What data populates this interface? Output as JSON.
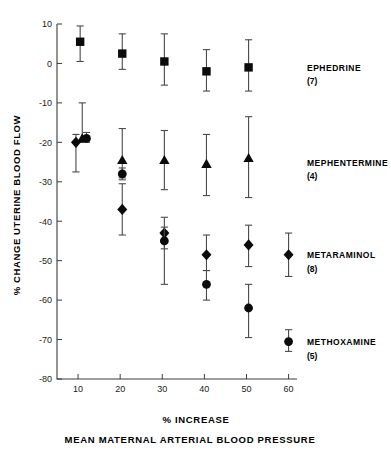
{
  "chart_data": {
    "type": "scatter",
    "title": "",
    "xlabel": "% INCREASE MEAN MATERNAL ARTERIAL BLOOD PRESSURE",
    "xlabel_line1": "% INCREASE",
    "xlabel_line2": "MEAN MATERNAL ARTERIAL BLOOD PRESSURE",
    "ylabel": "% CHANGE UTERINE BLOOD FLOW",
    "xlim": [
      5,
      62
    ],
    "ylim": [
      -80,
      10
    ],
    "xticks": [
      10,
      20,
      30,
      40,
      50,
      60
    ],
    "xtick_labels": [
      "10",
      "20",
      "30",
      "40",
      "50",
      "60"
    ],
    "yticks": [
      10,
      0,
      -10,
      -20,
      -30,
      -40,
      -50,
      -60,
      -70,
      -80
    ],
    "ytick_labels": [
      "10",
      "0",
      "-10",
      "-20",
      "-30",
      "-40",
      "-50",
      "-60",
      "-70",
      "-80"
    ],
    "grid": false,
    "legend_position": "right-inline",
    "error_type": "range",
    "series": [
      {
        "name": "EPHEDRINE",
        "n_label": "(7)",
        "n": 7,
        "marker": "square",
        "label_y": -1,
        "points": [
          {
            "x": 10.5,
            "y": 5.5,
            "err_low": 0.5,
            "err_high": 9.5
          },
          {
            "x": 20.5,
            "y": 2.5,
            "err_low": -1.5,
            "err_high": 7.5
          },
          {
            "x": 30.5,
            "y": 0.5,
            "err_low": -5.5,
            "err_high": 7.5
          },
          {
            "x": 40.5,
            "y": -2.0,
            "err_low": -7.0,
            "err_high": 3.5
          },
          {
            "x": 50.5,
            "y": -1.0,
            "err_low": -7.0,
            "err_high": 6.0
          }
        ]
      },
      {
        "name": "MEPHENTERMINE",
        "n_label": "(4)",
        "n": 4,
        "marker": "triangle",
        "label_y": -25,
        "points": [
          {
            "x": 11.0,
            "y": -19.0,
            "err_low": -20.0,
            "err_high": -10.0
          },
          {
            "x": 20.5,
            "y": -24.5,
            "err_low": -29.0,
            "err_high": -16.5
          },
          {
            "x": 30.5,
            "y": -24.5,
            "err_low": -32.0,
            "err_high": -17.0
          },
          {
            "x": 40.5,
            "y": -25.5,
            "err_low": -33.5,
            "err_high": -18.0
          },
          {
            "x": 50.5,
            "y": -24.0,
            "err_low": -34.0,
            "err_high": -13.5
          }
        ]
      },
      {
        "name": "METARAMINOL",
        "n_label": "(8)",
        "n": 8,
        "marker": "diamond",
        "label_y": -48.5,
        "points": [
          {
            "x": 9.5,
            "y": -20.0,
            "err_low": -27.5,
            "err_high": -18.0
          },
          {
            "x": 20.5,
            "y": -37.0,
            "err_low": -43.5,
            "err_high": -30.5
          },
          {
            "x": 30.5,
            "y": -43.0,
            "err_low": -47.0,
            "err_high": -39.0
          },
          {
            "x": 40.5,
            "y": -48.5,
            "err_low": -52.5,
            "err_high": -43.5
          },
          {
            "x": 50.5,
            "y": -46.0,
            "err_low": -51.5,
            "err_high": -41.0
          },
          {
            "x": 60.0,
            "y": -48.5,
            "err_low": -54.0,
            "err_high": -43.0
          }
        ]
      },
      {
        "name": "METHOXAMINE",
        "n_label": "(5)",
        "n": 5,
        "marker": "circle",
        "label_y": -70.5,
        "points": [
          {
            "x": 12.0,
            "y": -19.0,
            "err_low": -20.0,
            "err_high": -17.5
          },
          {
            "x": 20.5,
            "y": -28.0,
            "err_low": -29.5,
            "err_high": -26.5
          },
          {
            "x": 30.5,
            "y": -45.0,
            "err_low": -56.0,
            "err_high": -41.5
          },
          {
            "x": 40.5,
            "y": -56.0,
            "err_low": -60.0,
            "err_high": -52.5
          },
          {
            "x": 50.5,
            "y": -62.0,
            "err_low": -69.5,
            "err_high": -56.0
          },
          {
            "x": 60.0,
            "y": -70.5,
            "err_low": -73.0,
            "err_high": -67.5
          }
        ]
      }
    ]
  },
  "colors": {
    "marker": "#0b0b0b",
    "axis": "#3c3c3c",
    "errorbar": "#4a4a4a",
    "background": "#ffffff"
  }
}
